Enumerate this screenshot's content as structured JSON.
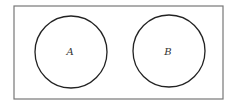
{
  "diagram": {
    "type": "venn",
    "universe": {
      "x": 14,
      "y": 6,
      "width": 209,
      "height": 93,
      "stroke": "#777777"
    },
    "sets": [
      {
        "label": "A",
        "cx": 71,
        "cy": 52,
        "r": 36,
        "stroke": "#222222"
      },
      {
        "label": "B",
        "cx": 169,
        "cy": 51,
        "r": 36,
        "stroke": "#222222"
      }
    ],
    "relationship": "disjoint"
  }
}
